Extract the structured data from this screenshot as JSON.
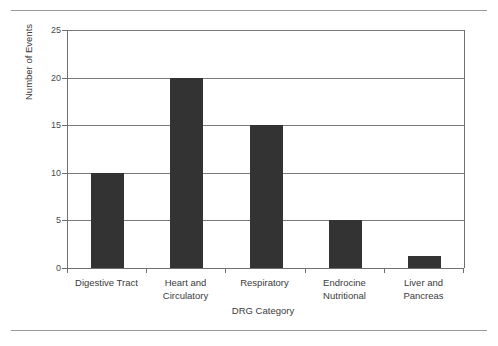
{
  "figure": {
    "rules": [
      "page-rule-top",
      "page-rule-bottom"
    ]
  },
  "chart_data": {
    "type": "bar",
    "title": "",
    "subtitle": "",
    "xlabel": "DRG Category",
    "ylabel": "Number of Events",
    "categories": [
      "Digestive Tract",
      "Heart and Circulatory",
      "Respiratory",
      "Endrocine Nutritional",
      "Liver and Pancreas"
    ],
    "category_label_lines": [
      [
        "Digestive Tract"
      ],
      [
        "Heart and",
        "Circulatory"
      ],
      [
        "Respiratory"
      ],
      [
        "Endrocine",
        "Nutritional"
      ],
      [
        "Liver and",
        "Pancreas"
      ]
    ],
    "values": [
      10,
      20,
      15,
      5,
      1.3
    ],
    "ylim": [
      0,
      25
    ],
    "yticks": [
      0,
      5,
      10,
      15,
      20,
      25
    ],
    "ytick_labels": [
      "0",
      "5",
      "10",
      "15",
      "20",
      "25"
    ],
    "grid": "horizontal",
    "legend": "none",
    "bar_color": "#333333",
    "grid_color": "#7a7a7a",
    "axis_color": "#6f6f6f",
    "background": "#ffffff"
  }
}
